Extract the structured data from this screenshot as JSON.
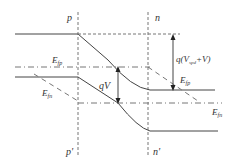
{
  "diagram": {
    "type": "pn-junction-band-diagram-forward-bias",
    "region_labels": {
      "p_top": "p",
      "n_top": "n",
      "p_bottom": "p'",
      "n_bottom": "n'"
    },
    "fermi_labels": {
      "efp_left": {
        "main": "E",
        "sub": "fp"
      },
      "efn_left": {
        "main": "E",
        "sub": "fn"
      },
      "efp_right": {
        "main": "E",
        "sub": "fp"
      },
      "efn_right": {
        "main": "E",
        "sub": "fn"
      }
    },
    "arrows": {
      "qv": {
        "text": "qV"
      },
      "barrier": {
        "prefix": "q(V",
        "sub": "spd",
        "suffix": "+V)"
      }
    },
    "colors": {
      "line": "#444444",
      "dashed": "#777777",
      "background": "#ffffff"
    }
  }
}
